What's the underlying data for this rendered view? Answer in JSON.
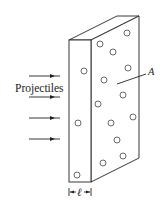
{
  "figure": {
    "projectiles_label": "Projectiles",
    "area_label": "A",
    "thickness_label": "ℓ",
    "projectile_count": 4,
    "front_face_hole_count": 3,
    "side_face_hole_count": 12
  }
}
